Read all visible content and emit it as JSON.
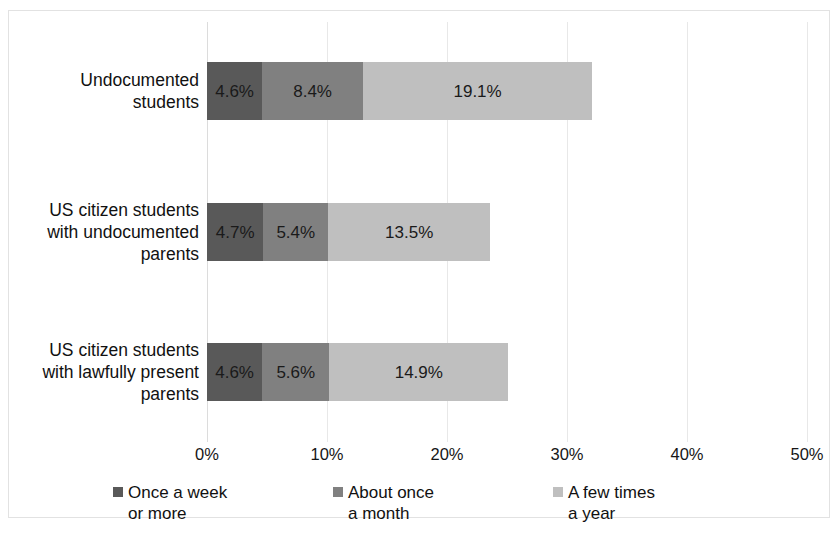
{
  "chart_data": {
    "type": "bar",
    "orientation": "horizontal",
    "stacked": true,
    "title": "",
    "xlabel": "",
    "ylabel": "",
    "xlim": [
      0,
      50
    ],
    "xtick_labels": [
      "0%",
      "10%",
      "20%",
      "30%",
      "40%",
      "50%"
    ],
    "xticks": [
      0,
      10,
      20,
      30,
      40,
      50
    ],
    "grid": true,
    "legend_position": "bottom",
    "categories": [
      "Undocumented students",
      "US citizen students with undocumented parents",
      "US citizen students with lawfully present parents"
    ],
    "category_lines": [
      [
        "Undocumented",
        "students"
      ],
      [
        "US citizen students",
        "with undocumented",
        "parents"
      ],
      [
        "US citizen students",
        "with lawfully present",
        "parents"
      ]
    ],
    "series": [
      {
        "name": "Once a week or more",
        "legend_lines": [
          "Once a week",
          "or more"
        ],
        "color": "#595959",
        "values": [
          4.6,
          4.7,
          4.6
        ],
        "labels": [
          "4.6%",
          "4.7%",
          "4.6%"
        ]
      },
      {
        "name": "About once a month",
        "legend_lines": [
          "About once",
          "a month"
        ],
        "color": "#808080",
        "values": [
          8.4,
          5.4,
          5.6
        ],
        "labels": [
          "8.4%",
          "5.4%",
          "5.6%"
        ]
      },
      {
        "name": "A few times a year",
        "legend_lines": [
          "A few times",
          "a year"
        ],
        "color": "#bfbfbf",
        "values": [
          19.1,
          13.5,
          14.9
        ],
        "labels": [
          "19.1%",
          "13.5%",
          "14.9%"
        ]
      }
    ]
  },
  "colors": {
    "series_dark": "#595959",
    "series_medium": "#808080",
    "series_light": "#bfbfbf",
    "gridline": "#e8e8e8",
    "frame_border": "#e2e2e2",
    "text": "#111111",
    "background": "#ffffff"
  }
}
